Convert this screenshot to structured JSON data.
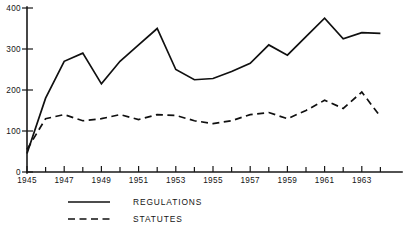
{
  "chart_data": {
    "type": "line",
    "title": "",
    "xlabel": "",
    "ylabel": "",
    "xlim": [
      1945,
      1964.5
    ],
    "ylim": [
      0,
      400
    ],
    "grid": false,
    "legend_position": "bottom-left",
    "y_ticks": [
      "0",
      "100",
      "200",
      "300",
      "400"
    ],
    "y_tick_values": [
      0,
      100,
      200,
      300,
      400
    ],
    "x_ticks": [
      "1945",
      "1947",
      "1949",
      "1951",
      "1953",
      "1955",
      "1957",
      "1959",
      "1961",
      "1963"
    ],
    "x_tick_values": [
      1945,
      1947,
      1949,
      1951,
      1953,
      1955,
      1957,
      1959,
      1961,
      1963
    ],
    "x_minor_tick_values": [
      1946,
      1948,
      1950,
      1952,
      1954,
      1956,
      1958,
      1960,
      1962,
      1964
    ],
    "x": [
      1945,
      1946,
      1947,
      1948,
      1949,
      1950,
      1951,
      1952,
      1953,
      1954,
      1955,
      1956,
      1957,
      1958,
      1959,
      1960,
      1961,
      1962,
      1963,
      1964
    ],
    "series": [
      {
        "name": "REGULATIONS",
        "style": "solid",
        "color": "#101010",
        "values": [
          45,
          180,
          270,
          290,
          215,
          270,
          310,
          350,
          250,
          225,
          228,
          245,
          265,
          310,
          285,
          330,
          375,
          325,
          340,
          338
        ]
      },
      {
        "name": "STATUTES",
        "style": "dashed",
        "color": "#101010",
        "values": [
          55,
          130,
          140,
          125,
          130,
          140,
          128,
          140,
          138,
          125,
          118,
          125,
          140,
          145,
          130,
          150,
          175,
          155,
          195,
          135
        ]
      }
    ]
  },
  "legend": {
    "entries": [
      {
        "label": "REGULATIONS",
        "style": "solid"
      },
      {
        "label": "STATUTES",
        "style": "dashed"
      }
    ]
  }
}
